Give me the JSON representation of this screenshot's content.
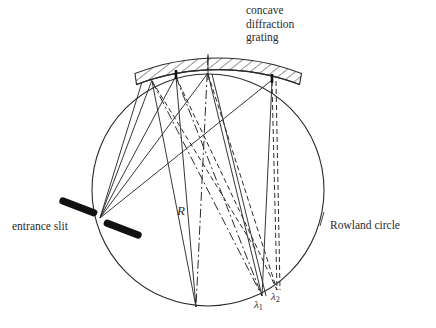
{
  "figure": {
    "type": "optical-schematic",
    "title_visible": false,
    "background_color": "#ffffff",
    "ink_color": "#2b2b2b",
    "width": 436,
    "height": 328
  },
  "labels": {
    "grating_line1": "concave",
    "grating_line2": "diffraction",
    "grating_line3": "grating",
    "entrance_slit": "entrance slit",
    "rowland_circle": "Rowland circle",
    "radius": "R",
    "lambda1_base": "λ",
    "lambda1_sub": "1",
    "lambda2_base": "λ",
    "lambda2_sub": "2"
  },
  "geometry": {
    "rowland_circle": {
      "cx": 208,
      "cy": 190,
      "r": 116,
      "stroke": "#2b2b2b",
      "stroke_width": 1.1
    },
    "grating": {
      "arc_radius": 232,
      "band_thickness": 10,
      "hatch_angle_deg": 52,
      "left_x": 137,
      "right_x": 299,
      "surface_y_center": 73
    },
    "entrance_slit": {
      "x": 100,
      "y": 218,
      "bar_length": 38,
      "bar_thickness": 7,
      "bar_angle_deg": 22,
      "gap": 7,
      "color": "#111111"
    },
    "grating_points": [
      {
        "name": "g1",
        "x": 152,
        "y": 79
      },
      {
        "name": "g2",
        "x": 176,
        "y": 75
      },
      {
        "name": "g3",
        "x": 208,
        "y": 72
      },
      {
        "name": "g4",
        "x": 272,
        "y": 79
      }
    ],
    "foci": [
      {
        "name": "lambda1",
        "x": 262,
        "y": 296
      },
      {
        "name": "lambda2",
        "x": 277,
        "y": 290
      },
      {
        "name": "zero_order",
        "x": 196,
        "y": 307
      }
    ],
    "center_axis": {
      "x1": 208,
      "y1": 56,
      "x2": 208,
      "y2": 72
    }
  },
  "line_styles": {
    "solid": "none",
    "dashed": "5,3",
    "dash_dot": "9,3,2,3"
  }
}
